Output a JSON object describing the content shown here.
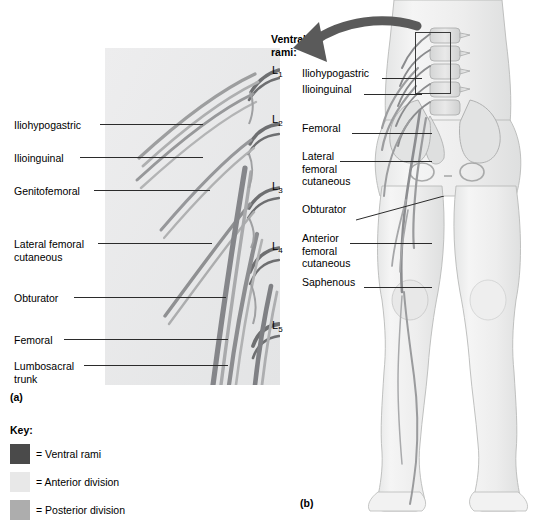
{
  "figure": {
    "panel_a_tag": "(a)",
    "panel_b_tag": "(b)",
    "ventral_rami_heading": "Ventral\nrami:"
  },
  "panel_a": {
    "tag": "(a)",
    "nerve_labels": [
      {
        "text": "Iliohypogastric",
        "x": 14,
        "y": 119,
        "leader_x": 100,
        "leader_y": 124,
        "leader_w": 103
      },
      {
        "text": "Ilioinguinal",
        "x": 14,
        "y": 152,
        "leader_x": 80,
        "leader_y": 157,
        "leader_w": 123
      },
      {
        "text": "Genitofemoral",
        "x": 14,
        "y": 185,
        "leader_x": 94,
        "leader_y": 190,
        "leader_w": 116
      },
      {
        "text": "Lateral femoral\ncutaneous",
        "x": 14,
        "y": 238,
        "leader_x": 98,
        "leader_y": 243,
        "leader_w": 114
      },
      {
        "text": "Obturator",
        "x": 14,
        "y": 292,
        "leader_x": 74,
        "leader_y": 297,
        "leader_w": 152
      },
      {
        "text": "Femoral",
        "x": 14,
        "y": 334,
        "leader_x": 64,
        "leader_y": 339,
        "leader_w": 164
      },
      {
        "text": "Lumbosacral\ntrunk",
        "x": 14,
        "y": 360,
        "leader_x": 84,
        "leader_y": 365,
        "leader_w": 144
      }
    ],
    "vertebra_labels": [
      {
        "letter": "L",
        "number": "1",
        "x": 272,
        "y": 64
      },
      {
        "letter": "L",
        "number": "2",
        "x": 272,
        "y": 113
      },
      {
        "letter": "L",
        "number": "3",
        "x": 272,
        "y": 180
      },
      {
        "letter": "L",
        "number": "4",
        "x": 272,
        "y": 240
      },
      {
        "letter": "L",
        "number": "5",
        "x": 272,
        "y": 319
      }
    ]
  },
  "panel_b": {
    "tag": "(b)",
    "nerve_labels": [
      {
        "text": "Iliohypogastric",
        "x": 302,
        "y": 73,
        "leader_x": 382,
        "leader_y": 78,
        "leader_w": 40
      },
      {
        "text": "Ilioinguinal",
        "x": 302,
        "y": 89,
        "leader_x": 364,
        "leader_y": 94,
        "leader_w": 58
      },
      {
        "text": "Femoral",
        "x": 302,
        "y": 128,
        "leader_x": 352,
        "leader_y": 133,
        "leader_w": 80
      },
      {
        "text": "Lateral\nfemoral\ncutaneous",
        "x": 302,
        "y": 156,
        "leader_x": 340,
        "leader_y": 161,
        "leader_w": 92
      },
      {
        "text": "Obturator",
        "x": 302,
        "y": 209,
        "leader_x": 360,
        "leader_y": 214,
        "leader_w": 72
      },
      {
        "text": "Anterior\nfemoral\ncutaneous",
        "x": 302,
        "y": 238,
        "leader_x": 350,
        "leader_y": 243,
        "leader_w": 82
      },
      {
        "text": "Saphenous",
        "x": 302,
        "y": 282,
        "leader_x": 364,
        "leader_y": 287,
        "leader_w": 68
      }
    ]
  },
  "key": {
    "title": "Key:",
    "items": [
      {
        "label": "= Ventral rami",
        "color": "#4a4a4a"
      },
      {
        "label": "= Anterior division",
        "color": "#e8e8e8"
      },
      {
        "label": "= Posterior division",
        "color": "#adadad"
      }
    ]
  },
  "colors": {
    "ventral_rami": "#4a4a4a",
    "anterior_division": "#e8e8e8",
    "posterior_division": "#adadad",
    "panel_a_bg": "#e9eaea",
    "body_fill": "#efefef",
    "bone_fill": "#dcdcdc",
    "leader_line": "#2b2b2b",
    "arrow": "#555555"
  }
}
